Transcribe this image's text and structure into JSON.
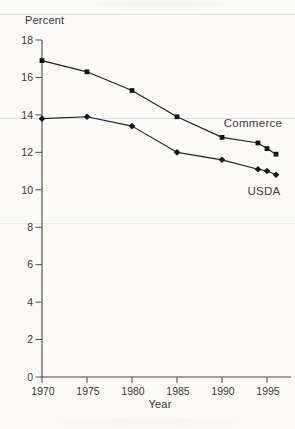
{
  "figure": {
    "background": "#fcfbf8",
    "scan_artifact_color": "#8fb4d2"
  },
  "chart_data": {
    "type": "line",
    "title": "",
    "ylabel": "Percent",
    "xlabel": "Year",
    "x": [
      1970,
      1975,
      1980,
      1985,
      1990,
      1994,
      1995,
      1996
    ],
    "series": [
      {
        "name": "Commerce",
        "marker": "square",
        "values": [
          16.9,
          16.3,
          15.3,
          13.9,
          12.8,
          12.5,
          12.2,
          11.9
        ]
      },
      {
        "name": "USDA",
        "marker": "diamond",
        "values": [
          13.8,
          13.9,
          13.4,
          12.0,
          11.6,
          11.1,
          11.0,
          10.8
        ]
      }
    ],
    "xticks": [
      1970,
      1975,
      1980,
      1985,
      1990,
      1995
    ],
    "yticks": [
      0,
      2,
      4,
      6,
      8,
      10,
      12,
      14,
      16,
      18
    ],
    "xlim": [
      1970,
      1997.7
    ],
    "ylim": [
      0,
      18
    ],
    "grid": false,
    "legend_position": "inline-annotations",
    "colors": {
      "line": "#1e1e28",
      "marker": "#15151d",
      "axis": "#4a4846",
      "tick_text": "#3a3733",
      "annotation_text": "#3f3a35"
    }
  }
}
